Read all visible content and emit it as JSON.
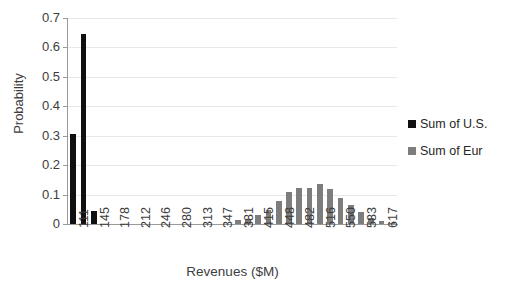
{
  "chart_data": {
    "type": "bar",
    "title": "",
    "xlabel": "Revenues ($M)",
    "ylabel": "Probability",
    "ylim": [
      0,
      0.7
    ],
    "ytick_labels": [
      "0.7",
      "0.6",
      "0.5",
      "0.4",
      "0.3",
      "0.2",
      "0.1",
      "0"
    ],
    "ytick_values": [
      0.7,
      0.6,
      0.5,
      0.4,
      0.3,
      0.2,
      0.1,
      0
    ],
    "grid": true,
    "legend_position": "right",
    "xtick_labels": [
      "111",
      "145",
      "178",
      "212",
      "246",
      "280",
      "313",
      "347",
      "381",
      "415",
      "448",
      "482",
      "516",
      "550",
      "583",
      "617"
    ],
    "xtick_values": [
      111,
      145,
      178,
      212,
      246,
      280,
      313,
      347,
      381,
      415,
      448,
      482,
      516,
      550,
      583,
      617
    ],
    "categories": [
      111,
      128,
      145,
      162,
      178,
      195,
      212,
      229,
      246,
      263,
      280,
      296,
      313,
      330,
      347,
      364,
      381,
      398,
      415,
      431,
      448,
      465,
      482,
      499,
      516,
      533,
      550,
      567,
      583,
      600,
      617,
      634
    ],
    "series": [
      {
        "name": "Sum of U.S.",
        "color": "#101010",
        "values": [
          0.305,
          0.645,
          0.045,
          0,
          0,
          0,
          0,
          0,
          0,
          0,
          0,
          0,
          0,
          0,
          0,
          0,
          0,
          0,
          0,
          0,
          0,
          0,
          0,
          0,
          0,
          0,
          0,
          0,
          0,
          0,
          0,
          0
        ]
      },
      {
        "name": "Sum of Eur",
        "color": "#7d7d7d",
        "values": [
          0,
          0,
          0,
          0,
          0,
          0,
          0,
          0,
          0,
          0,
          0,
          0,
          0,
          0,
          0,
          0,
          0.012,
          0.018,
          0.031,
          0.049,
          0.078,
          0.108,
          0.122,
          0.121,
          0.136,
          0.118,
          0.09,
          0.065,
          0.04,
          0.021,
          0.009,
          0.004
        ]
      }
    ]
  },
  "legend": {
    "items": [
      {
        "label": "Sum of U.S.",
        "color": "#101010"
      },
      {
        "label": "Sum of Eur",
        "color": "#7d7d7d"
      }
    ]
  }
}
